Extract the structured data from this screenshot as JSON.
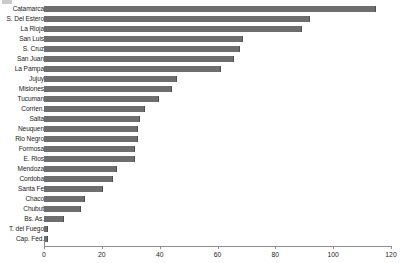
{
  "chart_data": {
    "type": "bar",
    "orientation": "horizontal",
    "title": "",
    "subtitle": "",
    "xlabel": "",
    "ylabel": "",
    "xlim": [
      0,
      120
    ],
    "xticks": [
      0,
      20,
      40,
      60,
      80,
      100,
      120
    ],
    "xtick_labels": [
      "0",
      "20",
      "40",
      "60",
      "80",
      "100",
      "120"
    ],
    "grid": false,
    "legend": null,
    "bar_color": "#6e6e6e",
    "axis_color": "#8d8d8d",
    "categories": [
      "Catamarca",
      "S. Del Estero",
      "La Rioja",
      "San Luis",
      "S. Cruz",
      "San Juan",
      "La Pampa",
      "Jujuy",
      "Misiones",
      "Tucuman",
      "Corrien.",
      "Salta",
      "Neuquen",
      "Rio Negro",
      "Formosa",
      "E. Rios",
      "Mendoza",
      "Cordoba",
      "Santa Fe",
      "Chaco",
      "Chubut",
      "Bs. As.",
      "T. del Fuego",
      "Cap. Fed."
    ],
    "values": [
      114.5,
      91.5,
      89.0,
      68.5,
      67.5,
      65.5,
      61.0,
      45.5,
      44.0,
      39.5,
      34.5,
      33.0,
      32.0,
      32.0,
      31.0,
      31.0,
      25.0,
      23.5,
      20.0,
      14.0,
      12.5,
      6.5,
      1.2,
      1.2
    ]
  }
}
